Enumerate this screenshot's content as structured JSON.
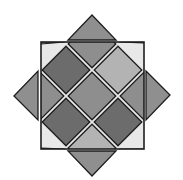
{
  "diagram": {
    "title": "",
    "colors": {
      "background": "#ffffff",
      "outline": "#1e1e1e",
      "separator": "#e8e8e8",
      "dark": "#6c6c6c",
      "medium": "#8e8e8e",
      "light": "#b3b3b3",
      "lighter": "#bdbdbd",
      "triangle": "#8f8f8f"
    },
    "tiles": [
      {
        "id": "center",
        "row": 0,
        "col": 0,
        "shade": "medium"
      },
      {
        "id": "top-left",
        "row": -1,
        "col": -1,
        "shade": "dark"
      },
      {
        "id": "top-right",
        "row": -1,
        "col": 1,
        "shade": "light"
      },
      {
        "id": "bottom-left",
        "row": 1,
        "col": -1,
        "shade": "dark"
      },
      {
        "id": "bottom-right",
        "row": 1,
        "col": 1,
        "shade": "dark"
      },
      {
        "id": "top",
        "row": -2,
        "col": 0,
        "shade": "medium"
      },
      {
        "id": "left",
        "row": 0,
        "col": -2,
        "shade": "medium"
      },
      {
        "id": "right",
        "row": 0,
        "col": 2,
        "shade": "medium"
      },
      {
        "id": "bottom",
        "row": 2,
        "col": 0,
        "shade": "light"
      }
    ],
    "corners": [
      {
        "id": "corner-top-left",
        "shade": "light"
      },
      {
        "id": "corner-top-right",
        "shade": "lighter"
      },
      {
        "id": "corner-bottom-left",
        "shade": "light"
      },
      {
        "id": "corner-bottom-right",
        "shade": "light"
      }
    ],
    "side_triangles": [
      {
        "id": "triangle-top",
        "side": "top",
        "shade": "triangle"
      },
      {
        "id": "triangle-left",
        "side": "left",
        "shade": "triangle"
      },
      {
        "id": "triangle-right",
        "side": "right",
        "shade": "triangle"
      },
      {
        "id": "triangle-bottom",
        "side": "bottom",
        "shade": "triangle"
      }
    ]
  }
}
